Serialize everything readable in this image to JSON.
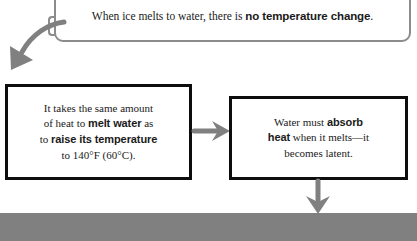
{
  "callout": {
    "text_before": "When ice melts to water, there is ",
    "text_bold": "no temperature change",
    "text_after": "."
  },
  "box_left": {
    "line1_a": "It takes the same amount",
    "line2_a": "of heat to ",
    "line2_b": "melt water",
    "line2_c": " as",
    "line3_a": "to ",
    "line3_b": "raise its temperature",
    "line4_a": "to 140°F (60°C)."
  },
  "box_right": {
    "line1_a": "Water must ",
    "line1_b": "absorb",
    "line2_b": "heat",
    "line2_c": " when it melts—it",
    "line3_a": "becomes latent."
  },
  "bottom_bar": {
    "text": "",
    "color": "#808080"
  },
  "arrows": {
    "curve_label": "curved-arrow-down-left",
    "right_label": "arrow-right",
    "down_label": "arrow-down",
    "color": "#808080"
  },
  "colors": {
    "box_border": "#0d0d0d",
    "callout_border": "#8c8c8c",
    "text": "#1a1a1a",
    "background": "#ffffff"
  }
}
